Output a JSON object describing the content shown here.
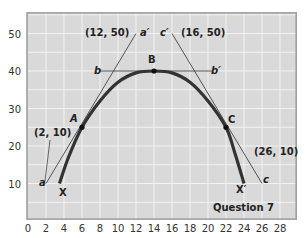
{
  "chart_data": {
    "type": "line",
    "title": "",
    "caption": "Question 7",
    "xlabel": "",
    "ylabel": "",
    "xlim": [
      0,
      29.8
    ],
    "ylim": [
      0.5,
      55.5
    ],
    "x_ticks": [
      0,
      2,
      4,
      6,
      8,
      10,
      12,
      14,
      16,
      18,
      20,
      22,
      24,
      26,
      28
    ],
    "y_ticks": [
      10,
      20,
      30,
      40,
      50
    ],
    "grid": true,
    "colors": {
      "plot_bg": "#d9d9d9",
      "grid": "#f2f2f2",
      "curve": "#333333",
      "lines": "#444444",
      "frame": "#9a9a9a"
    },
    "series": [
      {
        "name": "XX' curve",
        "x": [
          3.5,
          4.5,
          6,
          8,
          10,
          12,
          14,
          16,
          18,
          20,
          22,
          23,
          24
        ],
        "y": [
          10,
          17,
          25,
          32,
          37,
          39.5,
          40,
          39.5,
          37,
          32,
          25,
          18,
          10
        ]
      },
      {
        "name": "aa' tangent",
        "x": [
          2,
          12
        ],
        "y": [
          10,
          50
        ]
      },
      {
        "name": "bb' tangent",
        "x": [
          8,
          20.5
        ],
        "y": [
          40,
          40
        ]
      },
      {
        "name": "cc' tangent",
        "x": [
          16,
          26
        ],
        "y": [
          50,
          10
        ]
      }
    ],
    "points": [
      {
        "label": "A",
        "x": 6,
        "y": 25
      },
      {
        "label": "B",
        "x": 14,
        "y": 40
      },
      {
        "label": "C",
        "x": 22,
        "y": 25
      }
    ],
    "annotations": [
      {
        "text": "(12, 50)",
        "x": 12,
        "y": 50
      },
      {
        "text": "(16, 50)",
        "x": 16,
        "y": 50
      },
      {
        "text": "(2, 10)",
        "x": 2,
        "y": 10
      },
      {
        "text": "(26, 10)",
        "x": 26,
        "y": 10
      },
      {
        "text": "a",
        "x": 2,
        "y": 10
      },
      {
        "text": "a'",
        "x": 12,
        "y": 50
      },
      {
        "text": "b",
        "x": 8,
        "y": 40
      },
      {
        "text": "b'",
        "x": 20.5,
        "y": 40
      },
      {
        "text": "c",
        "x": 26,
        "y": 10
      },
      {
        "text": "c'",
        "x": 16,
        "y": 50
      },
      {
        "text": "X",
        "x": 3.5,
        "y": 10
      },
      {
        "text": "X'",
        "x": 24,
        "y": 10
      }
    ]
  },
  "labels": {
    "A": "A",
    "B": "B",
    "C": "C",
    "a": "a",
    "a_prime": "a′",
    "b": "b",
    "b_prime": "b′",
    "c": "c",
    "c_prime": "c′",
    "X": "X",
    "X_prime": "X′",
    "coord_a_prime": "(12, 50)",
    "coord_c_prime": "(16, 50)",
    "coord_a": "(2, 10)",
    "coord_c": "(26, 10)",
    "question": "Question 7"
  }
}
